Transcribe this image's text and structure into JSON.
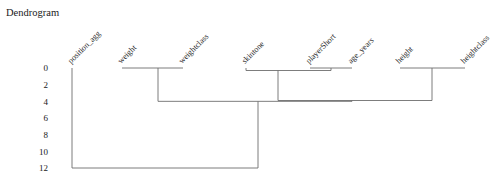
{
  "title": "Dendrogram",
  "chart_data": {
    "type": "dendrogram",
    "title": "Dendrogram",
    "xlabel": "",
    "ylabel": "",
    "grid": false,
    "legend": null,
    "orientation": "top",
    "ylim": [
      0,
      13
    ],
    "y_ticks": [
      "0",
      "2",
      "4",
      "6",
      "8",
      "10",
      "12"
    ],
    "y_tick_values": [
      0,
      2,
      4,
      6,
      8,
      10,
      12
    ],
    "leaf_labels": [
      "position_agg",
      "weight",
      "weightclass",
      "skintone",
      "playerShort",
      "age_years",
      "height",
      "heightclass"
    ],
    "leaf_x": [
      72,
      122,
      183,
      246,
      310,
      352,
      400,
      465
    ],
    "links": [
      {
        "id": "m1",
        "left": "weight",
        "right": "weightclass",
        "height": 0.0,
        "x_left": 122,
        "x_right": 183,
        "join_x": 158
      },
      {
        "id": "m2",
        "left": "playerShort",
        "right": "age_years",
        "height": 0.0,
        "x_left": 310,
        "x_right": 352,
        "join_x": 331
      },
      {
        "id": "m3",
        "left": "skintone",
        "right": "m2",
        "height": 0.3,
        "x_left": 246,
        "x_right": 331,
        "join_x": 278
      },
      {
        "id": "m4",
        "left": "height",
        "right": "heightclass",
        "height": 0.0,
        "x_left": 400,
        "x_right": 465,
        "join_x": 432
      },
      {
        "id": "m5",
        "left": "m3",
        "right": "m4",
        "height": 3.9,
        "x_left": 278,
        "x_right": 432,
        "join_x": 352
      },
      {
        "id": "m6",
        "left": "m1",
        "right": "m5",
        "height": 4.0,
        "x_left": 158,
        "x_right": 352,
        "join_x": 258
      },
      {
        "id": "m7",
        "left": "position_agg",
        "right": "m6",
        "height": 12.0,
        "x_left": 72,
        "x_right": 258,
        "join_x": 165
      }
    ],
    "line_color": "#6e6e6e",
    "background_color": "#ffffff"
  }
}
